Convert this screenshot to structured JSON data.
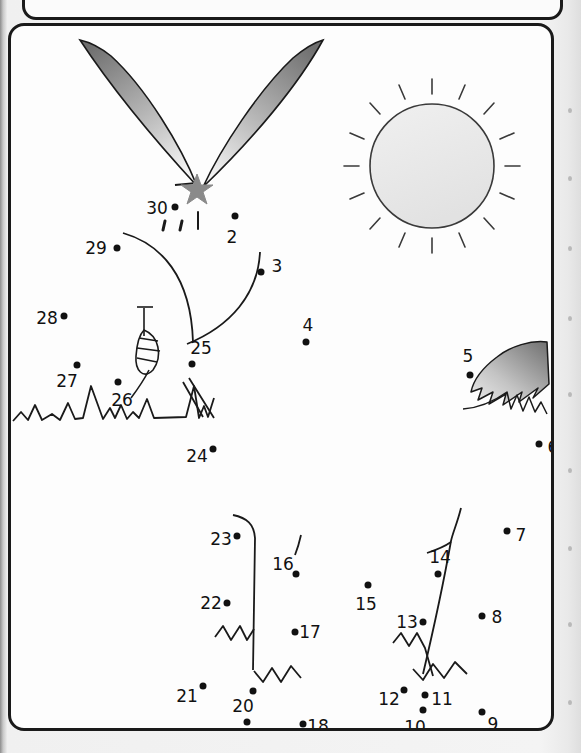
{
  "worksheet": {
    "type": "dot-to-dot",
    "title_panel_empty": true,
    "dot_count": 30,
    "subject": "bunny with sun and grass",
    "ink_color": "#111111",
    "panel_border_color": "#1a1a1a",
    "page_background": "#f2f2f2",
    "panel_background": "#fdfdfd",
    "shade_dark": "#6e6e6e",
    "shade_light": "#eeeeee",
    "star_color": "#8a8a8a"
  },
  "dots": [
    {
      "n": "1",
      "label": "1",
      "x": 192,
      "y": 182,
      "lx": 192,
      "ly": 205,
      "star": true
    },
    {
      "n": "2",
      "label": "2",
      "x": 224,
      "y": 190,
      "lx": 221,
      "ly": 211,
      "star": false
    },
    {
      "n": "3",
      "label": "3",
      "x": 250,
      "y": 246,
      "lx": 266,
      "ly": 240,
      "star": false
    },
    {
      "n": "4",
      "label": "4",
      "x": 295,
      "y": 316,
      "lx": 297,
      "ly": 299,
      "star": false
    },
    {
      "n": "5",
      "label": "5",
      "x": 459,
      "y": 349,
      "lx": 457,
      "ly": 330,
      "star": false
    },
    {
      "n": "6",
      "label": "6",
      "x": 528,
      "y": 418,
      "lx": 542,
      "ly": 421,
      "star": false
    },
    {
      "n": "7",
      "label": "7",
      "x": 496,
      "y": 505,
      "lx": 510,
      "ly": 509,
      "star": false
    },
    {
      "n": "8",
      "label": "8",
      "x": 471,
      "y": 590,
      "lx": 486,
      "ly": 591,
      "star": false
    },
    {
      "n": "9",
      "label": "9",
      "x": 471,
      "y": 686,
      "lx": 482,
      "ly": 698,
      "star": false
    },
    {
      "n": "10",
      "label": "10",
      "x": 412,
      "y": 684,
      "lx": 404,
      "ly": 701,
      "star": false
    },
    {
      "n": "11",
      "label": "11",
      "x": 414,
      "y": 669,
      "lx": 431,
      "ly": 673,
      "star": false
    },
    {
      "n": "12",
      "label": "12",
      "x": 393,
      "y": 664,
      "lx": 378,
      "ly": 673,
      "star": false
    },
    {
      "n": "13",
      "label": "13",
      "x": 412,
      "y": 596,
      "lx": 396,
      "ly": 596,
      "star": false
    },
    {
      "n": "14",
      "label": "14",
      "x": 427,
      "y": 548,
      "lx": 429,
      "ly": 531,
      "star": false
    },
    {
      "n": "15",
      "label": "15",
      "x": 357,
      "y": 559,
      "lx": 355,
      "ly": 578,
      "star": false
    },
    {
      "n": "16",
      "label": "16",
      "x": 285,
      "y": 548,
      "lx": 272,
      "ly": 538,
      "star": false
    },
    {
      "n": "17",
      "label": "17",
      "x": 284,
      "y": 606,
      "lx": 299,
      "ly": 606,
      "star": false
    },
    {
      "n": "18",
      "label": "18",
      "x": 292,
      "y": 698,
      "lx": 307,
      "ly": 700,
      "star": false
    },
    {
      "n": "19",
      "label": "19",
      "x": 236,
      "y": 696,
      "lx": 224,
      "ly": 710,
      "star": false
    },
    {
      "n": "20",
      "label": "20",
      "x": 242,
      "y": 665,
      "lx": 232,
      "ly": 680,
      "star": false
    },
    {
      "n": "21",
      "label": "21",
      "x": 192,
      "y": 660,
      "lx": 176,
      "ly": 670,
      "star": false
    },
    {
      "n": "22",
      "label": "22",
      "x": 216,
      "y": 577,
      "lx": 200,
      "ly": 577,
      "star": false
    },
    {
      "n": "23",
      "label": "23",
      "x": 226,
      "y": 510,
      "lx": 210,
      "ly": 513,
      "star": false
    },
    {
      "n": "24",
      "label": "24",
      "x": 202,
      "y": 423,
      "lx": 186,
      "ly": 430,
      "star": false
    },
    {
      "n": "25",
      "label": "25",
      "x": 181,
      "y": 338,
      "lx": 190,
      "ly": 322,
      "star": false
    },
    {
      "n": "26",
      "label": "26",
      "x": 107,
      "y": 356,
      "lx": 111,
      "ly": 374,
      "star": false
    },
    {
      "n": "27",
      "label": "27",
      "x": 66,
      "y": 339,
      "lx": 56,
      "ly": 355,
      "star": false
    },
    {
      "n": "28",
      "label": "28",
      "x": 53,
      "y": 290,
      "lx": 36,
      "ly": 292,
      "star": false
    },
    {
      "n": "29",
      "label": "29",
      "x": 106,
      "y": 222,
      "lx": 85,
      "ly": 222,
      "star": false
    },
    {
      "n": "30",
      "label": "30",
      "x": 164,
      "y": 181,
      "lx": 146,
      "ly": 182,
      "star": false
    }
  ],
  "decorations": {
    "sun": {
      "name": "sun",
      "cx": 429,
      "cy": 163,
      "r": 62,
      "rays": 16
    },
    "ear_left": {
      "name": "bunny-ear-left"
    },
    "ear_right": {
      "name": "bunny-ear-right"
    },
    "grass": {
      "name": "grass-tuft"
    },
    "leaf": {
      "name": "leaf-sprig"
    },
    "wing": {
      "name": "feather-sprig"
    },
    "leg_left": {
      "name": "leg-left-line"
    },
    "leg_right": {
      "name": "leg-right-line"
    }
  }
}
